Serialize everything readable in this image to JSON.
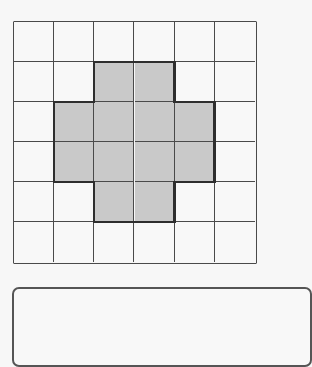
{
  "figure": {
    "type": "grid-shading-diagram",
    "rows": 6,
    "cols": 6,
    "shaded_cells": [
      [
        1,
        2
      ],
      [
        1,
        3
      ],
      [
        2,
        1
      ],
      [
        2,
        2
      ],
      [
        2,
        3
      ],
      [
        2,
        4
      ],
      [
        3,
        1
      ],
      [
        3,
        2
      ],
      [
        3,
        3
      ],
      [
        3,
        4
      ],
      [
        4,
        2
      ],
      [
        4,
        3
      ]
    ],
    "shaded_count": 12,
    "total_cells": 36,
    "shape_description": "cross / plus shape"
  },
  "colors": {
    "background": "#f7f7f7",
    "cell_white": "#f8f8f8",
    "cell_shaded": "#c9c9c9",
    "grid_line": "#4a4a4a",
    "shape_outline": "#2e2e2e",
    "answer_box_border": "#555555"
  },
  "answer_box": {
    "value": ""
  }
}
